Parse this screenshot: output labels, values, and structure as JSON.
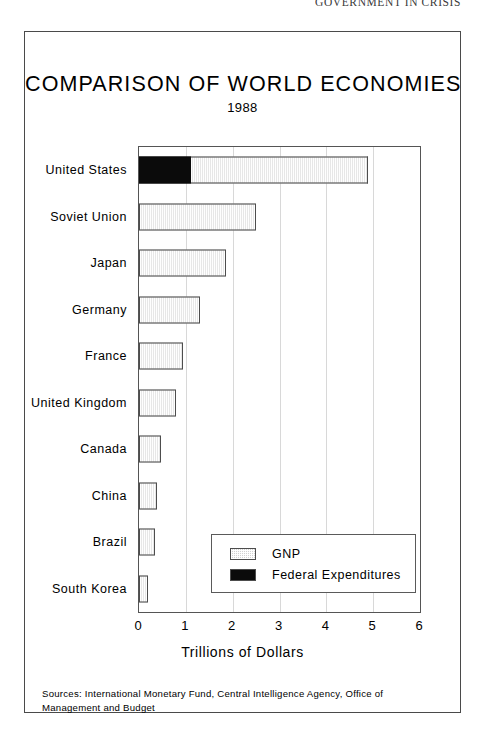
{
  "running_head": "GOVERNMENT IN CRISIS",
  "figure": {
    "title": "COMPARISON OF WORLD ECONOMIES",
    "subtitle": "1988",
    "source_note": "Sources:  International Monetary Fund, Central Intelligence Agency, Office of Management and Budget"
  },
  "legend": {
    "items": [
      {
        "label": "GNP",
        "swatch": "hatched-gray",
        "color": "#d2d2d2"
      },
      {
        "label": "Federal Expenditures",
        "swatch": "solid-black",
        "color": "#0b0b0b"
      }
    ]
  },
  "chart_data": {
    "type": "bar",
    "orientation": "horizontal",
    "stacked": true,
    "title": "COMPARISON OF WORLD ECONOMIES",
    "subtitle": "1988",
    "xlabel": "Trillions of Dollars",
    "ylabel": "",
    "xlim": [
      0,
      6
    ],
    "xticks": [
      0,
      1,
      2,
      3,
      4,
      5,
      6
    ],
    "xtick_labels": [
      "0",
      "1",
      "2",
      "3",
      "4",
      "5",
      "6"
    ],
    "grid": "vertical",
    "legend_position": "lower-right-inside",
    "categories": [
      "United States",
      "Soviet Union",
      "Japan",
      "Germany",
      "France",
      "United Kingdom",
      "Canada",
      "China",
      "Brazil",
      "South Korea"
    ],
    "series": [
      {
        "name": "Federal Expenditures",
        "color": "#0b0b0b",
        "values": [
          1.1,
          0,
          0,
          0,
          0,
          0,
          0,
          0,
          0,
          0
        ]
      },
      {
        "name": "GNP",
        "color": "#d2d2d2",
        "values": [
          4.9,
          2.5,
          1.85,
          1.3,
          0.95,
          0.78,
          0.48,
          0.38,
          0.35,
          0.2
        ]
      }
    ]
  }
}
